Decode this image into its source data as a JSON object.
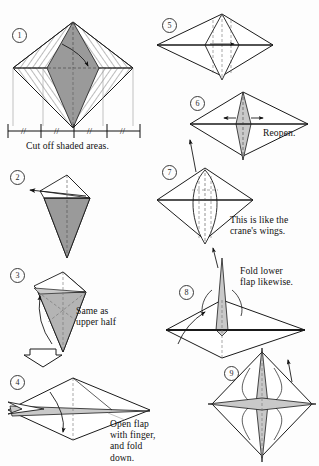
{
  "document": {
    "kind": "origami-instruction-diagram",
    "title": "Origami folding steps 1-9",
    "page_background": "#fdfdfd",
    "ink_color": "#111111"
  },
  "palette": {
    "shaded_gray": "#9a9a9a",
    "light_gray": "#c9c9c9",
    "pale_gray": "#e2e2e2",
    "line": "#1a1a1a",
    "dashed": "#6e6e6e",
    "white": "#ffffff"
  },
  "steps": [
    {
      "number": "1",
      "label": "step-1",
      "caption": "Cut off shaded areas.",
      "notes": "square rotated 45 degrees with hatched corner triangles and gray shaded vertical rhombus; measuring ruler below with equal tick marks"
    },
    {
      "number": "2",
      "label": "step-2",
      "caption": "",
      "notes": "kite shape, lower half shaded gray, arrow pointing left"
    },
    {
      "number": "3",
      "label": "step-3",
      "caption": "Same as\nupper half",
      "notes": "kite with curved arrow on left side, hollow down arrow below"
    },
    {
      "number": "4",
      "label": "step-4",
      "caption": "Open flap\nwith finger,\nand fold\ndown.",
      "notes": "wide horizontal diamond with pointed left flaps and downward arrow"
    },
    {
      "number": "5",
      "label": "step-5",
      "caption": "",
      "notes": "symmetric diamond with inner dashed petal creases"
    },
    {
      "number": "6",
      "label": "step-6",
      "caption": "Reopen.",
      "notes": "diamond with narrow center spike and outward arrows"
    },
    {
      "number": "7",
      "label": "step-7",
      "caption": "This is like the\ncrane's wings.",
      "notes": "diamond with rounded inner petal and dashed creases"
    },
    {
      "number": "8",
      "label": "step-8",
      "caption": "Fold lower\nflap likewise.",
      "notes": "diamond with tall vertical spike above and curved arrow"
    },
    {
      "number": "9",
      "label": "step-9",
      "caption": "",
      "notes": "finished four-pointed star form"
    }
  ],
  "ruler": {
    "label": "equal-spacing-ruler",
    "tick_count": 5,
    "segment_mark": "//",
    "segments": 4
  },
  "connectors": [
    {
      "name": "arrow-step3-to-step4",
      "type": "hollow-down-arrow"
    },
    {
      "name": "arrow-step6-to-step7",
      "type": "thin-up-arrow"
    },
    {
      "name": "arrow-step7-to-step8",
      "type": "thin-up-arrow"
    },
    {
      "name": "arrow-step8-to-step9",
      "type": "thin-up-arrow"
    }
  ]
}
